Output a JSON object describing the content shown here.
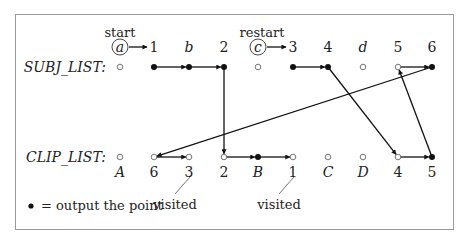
{
  "diagram": {
    "frame": {
      "x": 15,
      "y": 14,
      "w": 438,
      "h": 215,
      "stroke": "#9a9a9a"
    },
    "rows": {
      "subj": {
        "label": "SUBJ_LIST:",
        "y": 67
      },
      "clip": {
        "label": "CLIP_LIST:",
        "y": 157
      }
    },
    "columns_x": [
      120,
      154,
      189,
      224,
      258,
      293,
      328,
      363,
      398,
      432
    ],
    "subj_top_labels": [
      "a",
      "1",
      "b",
      "2",
      "c",
      "3",
      "4",
      "d",
      "5",
      "6"
    ],
    "subj_top_italic": [
      true,
      false,
      true,
      false,
      true,
      false,
      false,
      true,
      false,
      false
    ],
    "subj_points": [
      "open",
      "filled",
      "filled",
      "filled",
      "open",
      "filled",
      "filled",
      "open",
      "open",
      "filled"
    ],
    "clip_bottom_labels": [
      "A",
      "6",
      "3",
      "2",
      "B",
      "1",
      "C",
      "D",
      "4",
      "5"
    ],
    "clip_bottom_italic": [
      true,
      false,
      false,
      false,
      true,
      false,
      true,
      true,
      false,
      false
    ],
    "clip_points": [
      "open",
      "open",
      "open",
      "open",
      "filled",
      "open",
      "open",
      "open",
      "open",
      "filled"
    ],
    "annotations": {
      "start": "start",
      "restart": "restart",
      "visited_1": "visited",
      "visited_2": "visited",
      "legend_text": "= output the point"
    },
    "edges": [
      {
        "from": [
          "subj",
          1
        ],
        "to": [
          "subj",
          2
        ]
      },
      {
        "from": [
          "subj",
          2
        ],
        "to": [
          "subj",
          3
        ]
      },
      {
        "from": [
          "subj",
          3
        ],
        "to": [
          "clip",
          3
        ]
      },
      {
        "from": [
          "clip",
          3
        ],
        "to": [
          "clip",
          4
        ]
      },
      {
        "from": [
          "clip",
          4
        ],
        "to": [
          "clip",
          5
        ]
      },
      {
        "from": [
          "subj",
          5
        ],
        "to": [
          "subj",
          6
        ]
      },
      {
        "from": [
          "subj",
          6
        ],
        "to": [
          "clip",
          8
        ]
      },
      {
        "from": [
          "clip",
          8
        ],
        "to": [
          "clip",
          9
        ]
      },
      {
        "from": [
          "clip",
          9
        ],
        "to": [
          "subj",
          8
        ]
      },
      {
        "from": [
          "subj",
          8
        ],
        "to": [
          "subj",
          9
        ]
      },
      {
        "from": [
          "subj",
          9
        ],
        "to": [
          "clip",
          1
        ]
      },
      {
        "from": [
          "clip",
          1
        ],
        "to": [
          "clip",
          2
        ]
      }
    ],
    "start_arrows": [
      {
        "from_col": 0,
        "to_col": 1
      },
      {
        "from_col": 4,
        "to_col": 5
      }
    ]
  }
}
